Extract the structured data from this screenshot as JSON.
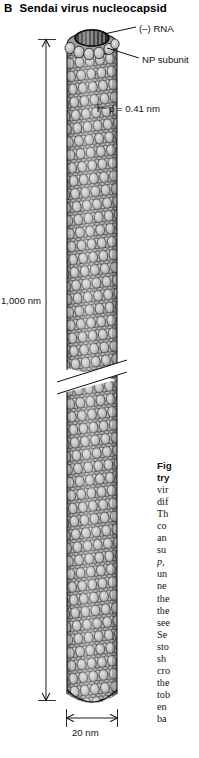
{
  "panel": {
    "letter": "B",
    "title": "Sendai virus nucleocapsid"
  },
  "labels": {
    "rna": "(–) RNA",
    "np_subunit": "NP subunit",
    "pitch": "p = 0.41 nm",
    "length": "1,000 nm",
    "width": "20 nm"
  },
  "caption": {
    "lines": [
      "Fig",
      "try",
      "vir",
      "dif",
      "Th",
      "co",
      "an",
      "su",
      "p,",
      "un",
      "ne",
      "the",
      "the",
      "see",
      "Se",
      "sto",
      "sh",
      "cro",
      "the",
      "tob",
      "en",
      "ba"
    ],
    "bold_line_count": 2,
    "italic_line_index": 8
  },
  "colors": {
    "ink": "#000000",
    "subunit_fill": "#b9b9b9",
    "subunit_fill_light": "#d2d2d2",
    "subunit_fill_dark": "#8f8f8f",
    "subunit_stroke": "#1a1a1a",
    "cap_dark": "#2b2b2b",
    "background": "#ffffff"
  },
  "diagram": {
    "type": "helical-nucleocapsid-schematic",
    "organism": "Sendai virus",
    "filament_top_y": 32,
    "filament_bottom_y": 703,
    "filament_left_x": 67,
    "filament_right_x": 117,
    "break_y": 372,
    "subunit_rows": 52,
    "subunits_per_row": 5
  }
}
